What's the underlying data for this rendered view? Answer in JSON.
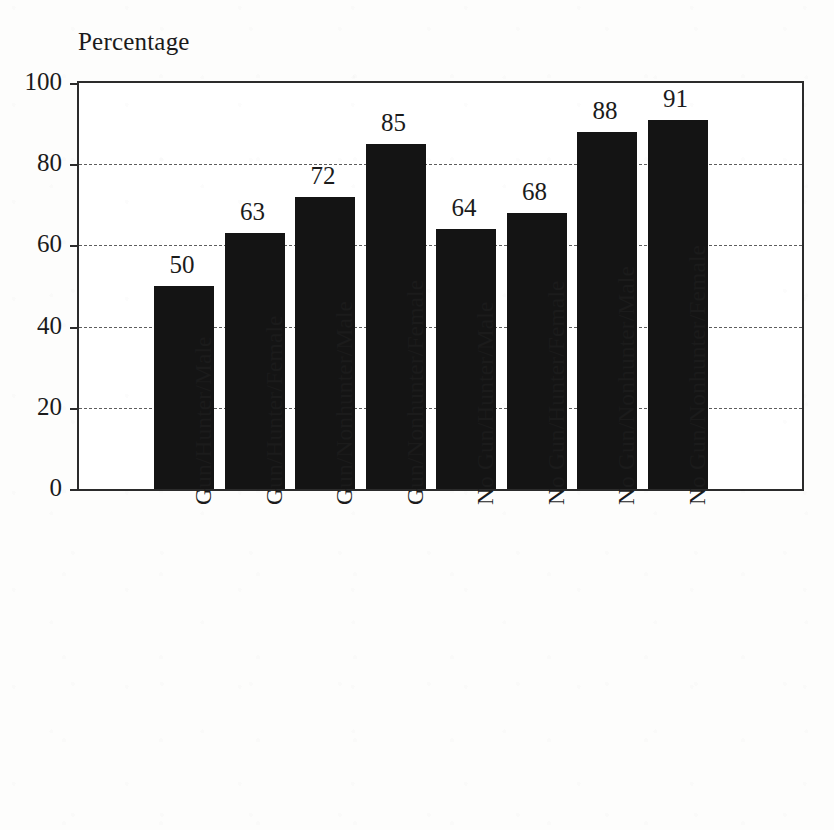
{
  "chart_data": {
    "type": "bar",
    "title": "",
    "ylabel": "Percentage",
    "xlabel": "",
    "ylim": [
      0,
      100
    ],
    "yticks": [
      0,
      20,
      40,
      60,
      80,
      100
    ],
    "ytick_labels": [
      "0",
      "20",
      "40",
      "60",
      "80",
      "100"
    ],
    "gridlines": [
      20,
      40,
      60,
      80
    ],
    "grid": true,
    "legend": "none",
    "orientation": "vertical",
    "bar_color": "#141414",
    "categories": [
      "Gun/Hunter/Male",
      "Gun/Hunter/Female",
      "Gun/Nonhunter/Male",
      "Gun/Nonhunter/Female",
      "No Gun/Hunter/Male",
      "No Gun/Hunter/Female",
      "No Gun/Nonhunter/Male",
      "No Gun/Nonhunter/Female"
    ],
    "values": [
      50,
      63,
      72,
      85,
      64,
      68,
      88,
      91
    ],
    "value_labels": [
      "50",
      "63",
      "72",
      "85",
      "64",
      "68",
      "88",
      "91"
    ],
    "xtick_label_rotation": 90
  },
  "colors": {
    "bar": "#141414",
    "axis": "#2b2b2b",
    "grid": "#5d5d5d",
    "text": "#1b1b1b",
    "background": "#fdfdfc"
  }
}
